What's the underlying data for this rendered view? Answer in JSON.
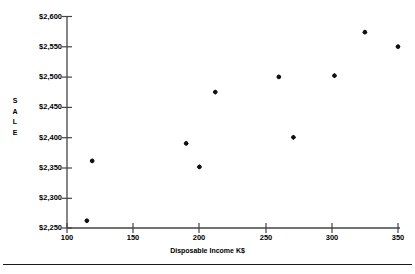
{
  "chart_data": {
    "type": "scatter",
    "title": "",
    "xlabel": "Disposable Income K$",
    "ylabel": "SALE",
    "ylabel_letters": [
      "S",
      "A",
      "L",
      "E"
    ],
    "x": [
      115,
      119,
      190,
      200,
      212,
      260,
      271,
      302,
      325,
      350
    ],
    "y": [
      2262,
      2361,
      2390,
      2351,
      2475,
      2500,
      2400,
      2502,
      2574,
      2550
    ],
    "points": [
      {
        "x": 115,
        "y": 2262
      },
      {
        "x": 119,
        "y": 2361
      },
      {
        "x": 190,
        "y": 2390
      },
      {
        "x": 200,
        "y": 2351
      },
      {
        "x": 212,
        "y": 2475
      },
      {
        "x": 260,
        "y": 2500
      },
      {
        "x": 271,
        "y": 2400
      },
      {
        "x": 302,
        "y": 2502
      },
      {
        "x": 325,
        "y": 2574
      },
      {
        "x": 350,
        "y": 2550
      }
    ],
    "xlim": [
      100,
      350
    ],
    "ylim": [
      2250,
      2600
    ],
    "xticks": [
      100,
      150,
      200,
      250,
      300,
      350
    ],
    "yticks": [
      2250,
      2300,
      2350,
      2400,
      2450,
      2500,
      2550,
      2600
    ],
    "xtick_labels": [
      "100",
      "150",
      "200",
      "250",
      "300",
      "350"
    ],
    "ytick_labels": [
      "$2,250",
      "$2,300",
      "$2,350",
      "$2,400",
      "$2,450",
      "$2,500",
      "$2,550",
      "$2,600"
    ],
    "grid": false,
    "legend": null,
    "marker": "filled-diamond",
    "marker_color": "#111111",
    "axis_color": "#444444"
  }
}
